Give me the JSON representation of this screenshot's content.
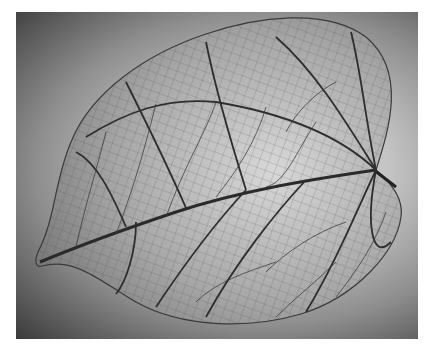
{
  "image": {
    "subject": "leaf skeleton",
    "description": "Black-and-white photograph of a heart-shaped leaf skeleton showing its vein network, stem at right, tip at lower left",
    "colors": {
      "border": "#ffffff",
      "background_dark": "#3a3a3a",
      "background_light": "#e6e6e6",
      "leaf_fill": "#bdbdbd",
      "vein": "#2a2a2a"
    }
  }
}
